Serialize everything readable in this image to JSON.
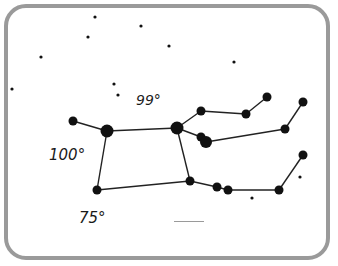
{
  "figure": {
    "frame_color": "#9a9a9a",
    "star_color": "#111111",
    "line_color": "#222222"
  },
  "labels": {
    "angle_top": "99°",
    "angle_left": "100°",
    "angle_bottom_left": "75°"
  },
  "answer_blank": {
    "value": ""
  },
  "constellation": {
    "stars": [
      {
        "id": "s1",
        "x": 73,
        "y": 121,
        "r": 4.5
      },
      {
        "id": "s2",
        "x": 107,
        "y": 131,
        "r": 6.5
      },
      {
        "id": "s3",
        "x": 177,
        "y": 128,
        "r": 6.5
      },
      {
        "id": "s4",
        "x": 201,
        "y": 111,
        "r": 4.5
      },
      {
        "id": "s5",
        "x": 246,
        "y": 114,
        "r": 4.5
      },
      {
        "id": "s6",
        "x": 267,
        "y": 97,
        "r": 4.5
      },
      {
        "id": "s7",
        "x": 201,
        "y": 137,
        "r": 4.5
      },
      {
        "id": "s8",
        "x": 206,
        "y": 142,
        "r": 6
      },
      {
        "id": "s9",
        "x": 285,
        "y": 129,
        "r": 4.5
      },
      {
        "id": "s10",
        "x": 303,
        "y": 102,
        "r": 4.5
      },
      {
        "id": "s11",
        "x": 97,
        "y": 190,
        "r": 4.5
      },
      {
        "id": "s12",
        "x": 190,
        "y": 181,
        "r": 4.5
      },
      {
        "id": "s13",
        "x": 217,
        "y": 187,
        "r": 4.5
      },
      {
        "id": "s14",
        "x": 228,
        "y": 190,
        "r": 4.5
      },
      {
        "id": "s15",
        "x": 279,
        "y": 190,
        "r": 4.5
      },
      {
        "id": "s16",
        "x": 303,
        "y": 155,
        "r": 4.5
      }
    ],
    "lines": [
      [
        "s1",
        "s2"
      ],
      [
        "s2",
        "s3"
      ],
      [
        "s2",
        "s11"
      ],
      [
        "s11",
        "s12"
      ],
      [
        "s3",
        "s12"
      ],
      [
        "s3",
        "s4"
      ],
      [
        "s4",
        "s5"
      ],
      [
        "s5",
        "s6"
      ],
      [
        "s3",
        "s7"
      ],
      [
        "s8",
        "s9"
      ],
      [
        "s9",
        "s10"
      ],
      [
        "s12",
        "s13"
      ],
      [
        "s13",
        "s14"
      ],
      [
        "s14",
        "s15"
      ],
      [
        "s15",
        "s16"
      ]
    ],
    "background_stars": [
      {
        "x": 95,
        "y": 17
      },
      {
        "x": 141,
        "y": 26
      },
      {
        "x": 88,
        "y": 37
      },
      {
        "x": 169,
        "y": 46
      },
      {
        "x": 41,
        "y": 57
      },
      {
        "x": 234,
        "y": 62
      },
      {
        "x": 12,
        "y": 89
      },
      {
        "x": 114,
        "y": 84
      },
      {
        "x": 118,
        "y": 95
      },
      {
        "x": 300,
        "y": 177
      },
      {
        "x": 252,
        "y": 198
      }
    ]
  }
}
